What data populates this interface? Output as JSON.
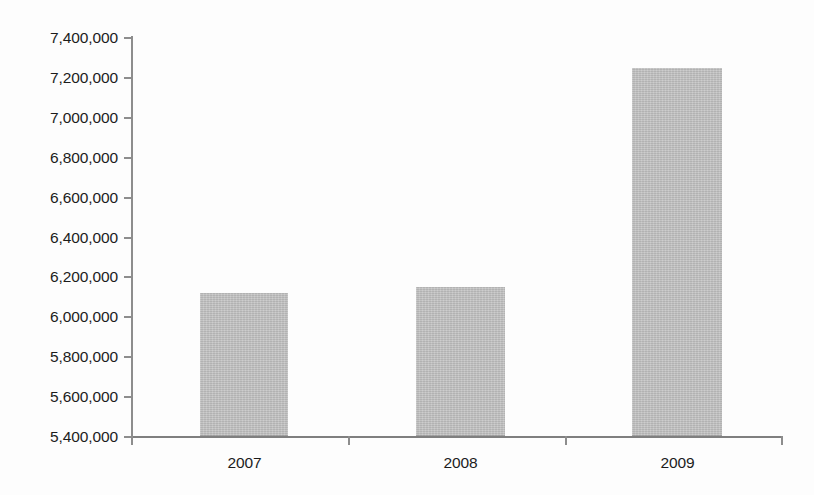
{
  "chart_data": {
    "type": "bar",
    "title": "",
    "subtitle": "",
    "xlabel": "",
    "ylabel": "",
    "categories": [
      "2007",
      "2008",
      "2009"
    ],
    "values": [
      6120000,
      6150000,
      7245000
    ],
    "series": [
      {
        "name": "",
        "values": [
          6120000,
          6150000,
          7245000
        ]
      }
    ],
    "ylim": [
      5400000,
      7400000
    ],
    "ytick_step": 200000,
    "ytick_labels": [
      "7,400,000",
      "7,200,000",
      "7,000,000",
      "6,800,000",
      "6,600,000",
      "6,400,000",
      "6,200,000",
      "6,000,000",
      "5,800,000",
      "5,600,000",
      "5,400,000"
    ],
    "ytick_values": [
      7400000,
      7200000,
      7000000,
      6800000,
      6600000,
      6400000,
      6200000,
      6000000,
      5800000,
      5600000,
      5400000
    ],
    "grid": false,
    "legend": false,
    "legend_position": "none",
    "annotations": [],
    "colors": {
      "bar_fill": "#bcbcbc",
      "axis_line": "#8d8d8d",
      "tick_text": "#1c1c1c",
      "background": "#fdfdfd"
    }
  }
}
